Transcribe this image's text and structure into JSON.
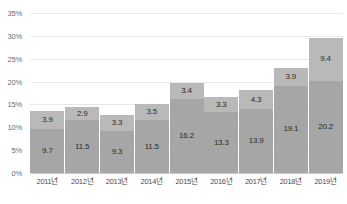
{
  "chart_data": {
    "type": "bar",
    "stacked": true,
    "title": "",
    "subtitle": "",
    "xlabel": "",
    "ylabel": "",
    "categories": [
      "2011년",
      "2012년",
      "2013년",
      "2014년",
      "2015년",
      "2016년",
      "2017년",
      "2018년",
      "2019년"
    ],
    "series": [
      {
        "name": "lower",
        "values": [
          9.7,
          11.5,
          9.3,
          11.5,
          16.2,
          13.3,
          13.9,
          19.1,
          20.2
        ],
        "color": "#a6a6a6"
      },
      {
        "name": "upper",
        "values": [
          3.9,
          2.9,
          3.3,
          3.5,
          3.4,
          3.3,
          4.3,
          3.9,
          9.4
        ],
        "color": "#b9b9b9"
      }
    ],
    "totals": [
      13.6,
      14.4,
      12.6,
      15.0,
      19.6,
      16.6,
      18.2,
      23.0,
      29.6
    ],
    "ylim": [
      0,
      35
    ],
    "y_ticks": [
      0,
      5,
      10,
      15,
      20,
      25,
      30,
      35
    ],
    "y_tick_labels": [
      "0%",
      "5%",
      "10%",
      "15%",
      "20%",
      "25%",
      "30%",
      "35%"
    ],
    "grid": true,
    "legend": false,
    "legend_position": "none"
  },
  "axis": {
    "y_labels": [
      "35%",
      "30%",
      "25%",
      "20%",
      "15%",
      "10%",
      "5%",
      "0%"
    ]
  },
  "colors": {
    "background": "#ffffff",
    "gridline": "#e8e8ea",
    "baseline": "#c9c9cc",
    "bar_lower": "#a6a6a6",
    "bar_upper": "#b9b9b9",
    "label_text": "#2b2b2b",
    "axis_text": "#6c6c70"
  }
}
